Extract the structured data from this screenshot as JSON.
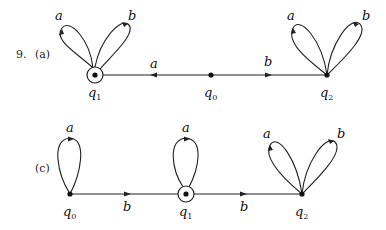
{
  "problem_number": "9.",
  "diagrams": [
    {
      "id": "a",
      "tag": "(a)",
      "states": [
        {
          "name": "q",
          "sub": "1",
          "accepting": true,
          "x": 95,
          "y": 75
        },
        {
          "name": "q",
          "sub": "0",
          "accepting": false,
          "x": 211,
          "y": 75
        },
        {
          "name": "q",
          "sub": "2",
          "accepting": false,
          "x": 327,
          "y": 75
        }
      ],
      "transitions": [
        {
          "from": "q0",
          "to": "q1",
          "label": "a"
        },
        {
          "from": "q0",
          "to": "q2",
          "label": "b"
        },
        {
          "from": "q1",
          "to": "q1",
          "label": "a"
        },
        {
          "from": "q1",
          "to": "q1",
          "label": "b"
        },
        {
          "from": "q2",
          "to": "q2",
          "label": "a"
        },
        {
          "from": "q2",
          "to": "q2",
          "label": "b"
        }
      ]
    },
    {
      "id": "c",
      "tag": "(c)",
      "states": [
        {
          "name": "q",
          "sub": "0",
          "accepting": false,
          "x": 70,
          "y": 194
        },
        {
          "name": "q",
          "sub": "1",
          "accepting": true,
          "x": 186,
          "y": 194
        },
        {
          "name": "q",
          "sub": "2",
          "accepting": false,
          "x": 302,
          "y": 194
        }
      ],
      "transitions": [
        {
          "from": "q0",
          "to": "q0",
          "label": "a"
        },
        {
          "from": "q0",
          "to": "q1",
          "label": "b"
        },
        {
          "from": "q1",
          "to": "q1",
          "label": "a"
        },
        {
          "from": "q1",
          "to": "q2",
          "label": "b"
        },
        {
          "from": "q2",
          "to": "q2",
          "label": "a"
        },
        {
          "from": "q2",
          "to": "q2",
          "label": "b"
        }
      ]
    }
  ]
}
